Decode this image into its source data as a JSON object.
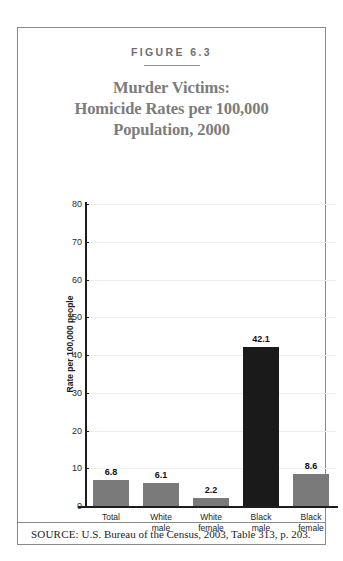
{
  "figure": {
    "number_label": "FIGURE 6.3",
    "title_lines": [
      "Murder Victims:",
      "Homicide Rates per 100,000",
      "Population, 2000"
    ],
    "source_lead": "SOURCE:",
    "source_text": "U.S. Bureau of the Census, 2003, Table 313, p. 203."
  },
  "colors": {
    "frame": "#8a8a8a",
    "title": "#7c7c7c",
    "fig_number": "#6f6f6f",
    "bar_gray": "#7a7a7a",
    "bar_black": "#1a1a1a",
    "gridline": "#ededed",
    "axis": "#1d1d1d"
  },
  "chart_data": {
    "type": "bar",
    "title": "Murder Victims: Homicide Rates per 100,000 Population, 2000",
    "xlabel": "",
    "ylabel": "Rate per 100,000 people",
    "ylim": [
      0,
      80
    ],
    "ytick_step": 10,
    "yticks": [
      "0",
      "10",
      "20",
      "30",
      "40",
      "50",
      "60",
      "70",
      "80"
    ],
    "grid": true,
    "legend": false,
    "categories": [
      "Total",
      "White\nmale",
      "White\nfemale",
      "Black\nmale",
      "Black\nfemale"
    ],
    "category_lines": [
      [
        "Total"
      ],
      [
        "White",
        "male"
      ],
      [
        "White",
        "female"
      ],
      [
        "Black",
        "male"
      ],
      [
        "Black",
        "female"
      ]
    ],
    "values": [
      6.8,
      6.1,
      2.2,
      42.1,
      8.6
    ],
    "value_labels": [
      "6.8",
      "6.1",
      "2.2",
      "42.1",
      "8.6"
    ],
    "bar_colors": [
      "#7a7a7a",
      "#7a7a7a",
      "#7a7a7a",
      "#1a1a1a",
      "#7a7a7a"
    ]
  }
}
